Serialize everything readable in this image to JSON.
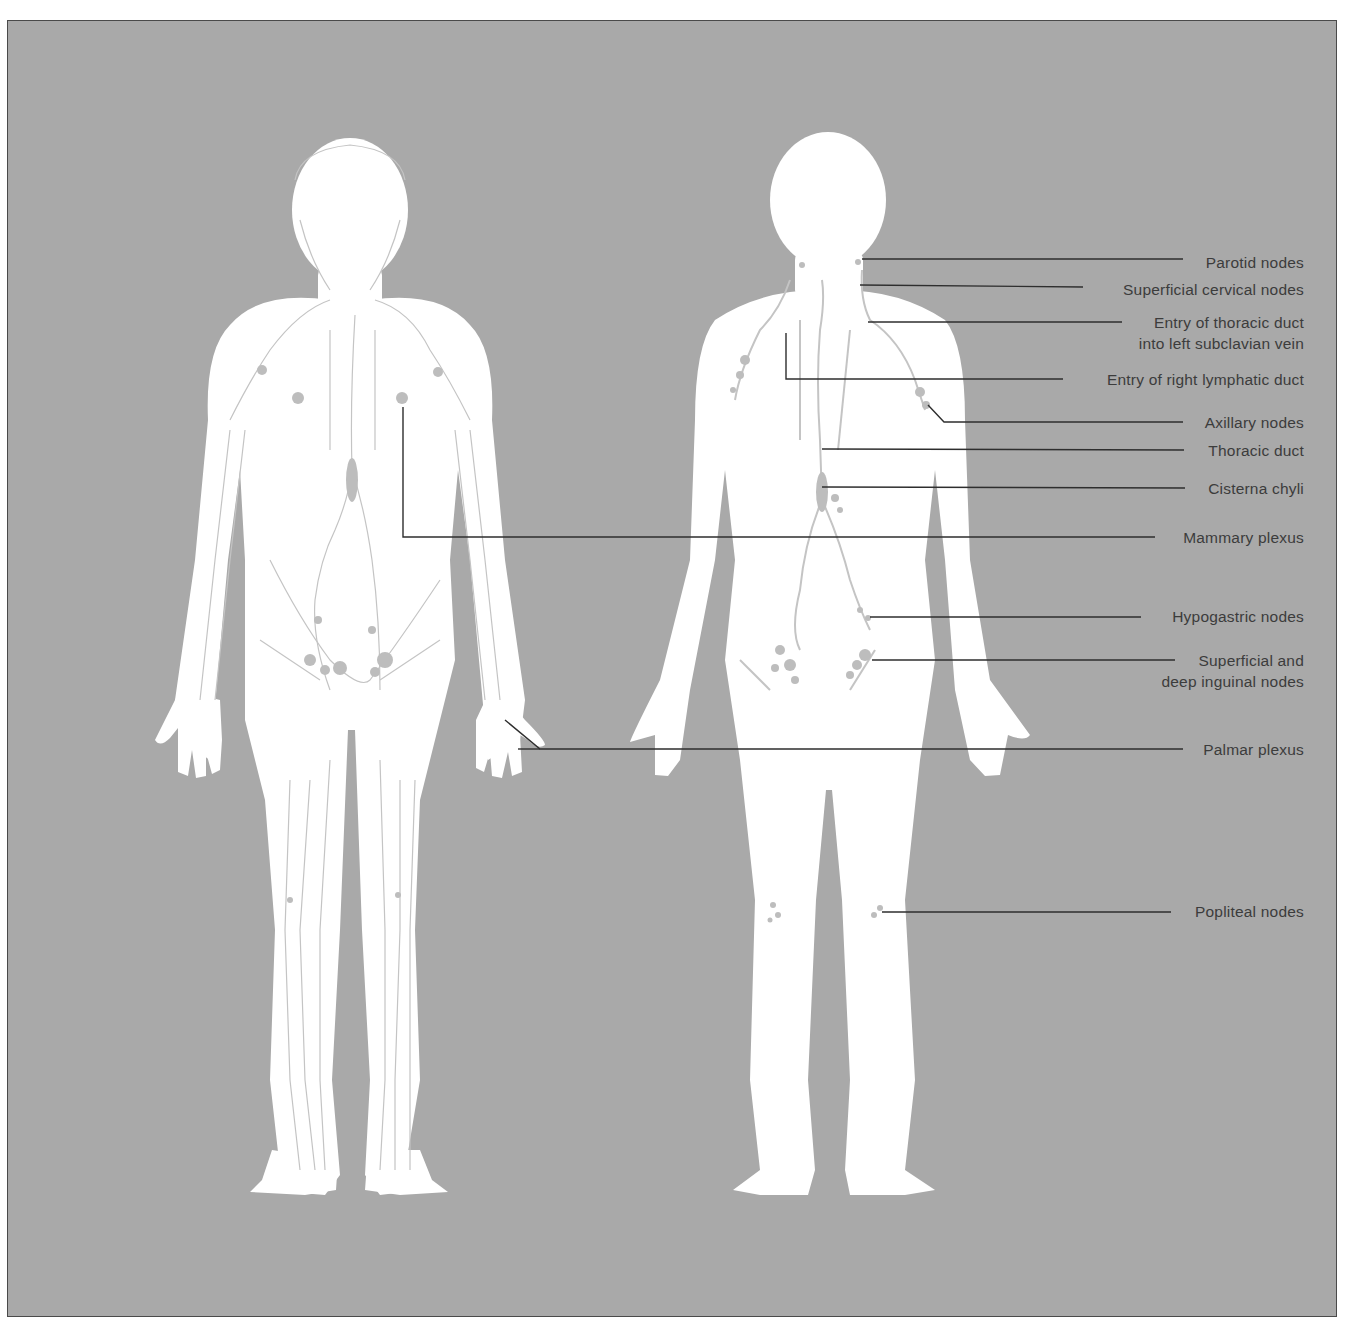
{
  "figure": {
    "background_color": "#a9a9a9",
    "body_color": "#ffffff",
    "vessel_color": "#c4c4c4",
    "leader_color": "#2e2e2e",
    "text_color": "#3c3c3c"
  },
  "left_figure": {
    "name": "superficial lymphatic vessels figure",
    "annotation": "Mammary plexus and Palmar plexus leaders originate here"
  },
  "right_figure": {
    "name": "deep lymph nodes figure"
  },
  "labels": [
    {
      "id": "parotid",
      "text": "Parotid nodes",
      "line2": "",
      "y": 252,
      "anchor": [
        862,
        259
      ]
    },
    {
      "id": "superficial-cervical",
      "text": "Superficial cervical nodes",
      "line2": "",
      "y": 280,
      "anchor": [
        860,
        285
      ]
    },
    {
      "id": "thoracic-duct-entry",
      "text": "Entry of thoracic duct",
      "line2": "into left subclavian vein",
      "y": 313,
      "anchor": [
        868,
        322
      ]
    },
    {
      "id": "right-lymphatic-duct",
      "text": "Entry of right lymphatic duct",
      "line2": "",
      "y": 369,
      "anchor": [
        786,
        379
      ]
    },
    {
      "id": "axillary",
      "text": "Axillary nodes",
      "line2": "",
      "y": 413,
      "anchor": [
        928,
        405
      ]
    },
    {
      "id": "thoracic-duct",
      "text": "Thoracic duct",
      "line2": "",
      "y": 441,
      "anchor": [
        822,
        449
      ]
    },
    {
      "id": "cisterna-chyli",
      "text": "Cisterna chyli",
      "line2": "",
      "y": 479,
      "anchor": [
        822,
        487
      ]
    },
    {
      "id": "mammary-plexus",
      "text": "Mammary plexus",
      "line2": "",
      "y": 528,
      "anchor": [
        403,
        537
      ]
    },
    {
      "id": "hypogastric",
      "text": "Hypogastric nodes",
      "line2": "",
      "y": 607,
      "anchor": [
        870,
        617
      ]
    },
    {
      "id": "inguinal",
      "text": "Superficial and",
      "line2": "deep inguinal nodes",
      "y": 651,
      "anchor": [
        872,
        660
      ]
    },
    {
      "id": "palmar-plexus",
      "text": "Palmar plexus",
      "line2": "",
      "y": 740,
      "anchor": [
        518,
        749
      ]
    },
    {
      "id": "popliteal",
      "text": "Popliteal nodes",
      "line2": "",
      "y": 902,
      "anchor": [
        882,
        912
      ]
    }
  ]
}
